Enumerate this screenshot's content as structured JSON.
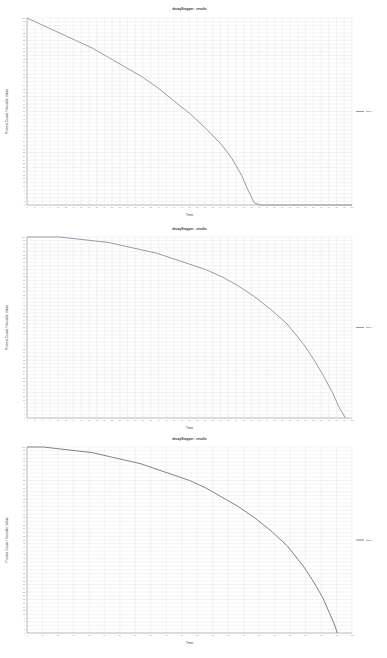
{
  "charts": [
    {
      "title": "decayStopper - results",
      "xlabel": "Time",
      "ylabel": "Protein Count / Variable Value",
      "legend": "DECAY",
      "line_color": "#8c8fa6"
    },
    {
      "title": "decayStopper - results",
      "xlabel": "Time",
      "ylabel": "Protein Count / Variable Value",
      "legend": "DECAY",
      "line_color": "#8c8fa6"
    },
    {
      "title": "decayStopper - results",
      "xlabel": "Time",
      "ylabel": "Protein Count / Variable Value",
      "legend": "DECAY",
      "line_color": "#6f7286"
    }
  ],
  "chart_data": [
    {
      "type": "line",
      "title": "decayStopper - results",
      "xlabel": "Time",
      "ylabel": "Protein Count / Variable Value",
      "xlim": [
        0,
        100
      ],
      "ylim": [
        0,
        100
      ],
      "grid": true,
      "legend_position": "right",
      "series": [
        {
          "name": "DECAY",
          "x": [
            0,
            5,
            10,
            15,
            20,
            25,
            30,
            35,
            40,
            45,
            50,
            55,
            60,
            63,
            66,
            68,
            70,
            72,
            75,
            80,
            85,
            90,
            95,
            100
          ],
          "y": [
            100,
            96,
            92,
            88,
            84,
            79,
            74,
            69,
            63,
            56,
            49,
            41,
            32,
            25,
            16,
            8,
            1,
            0,
            0,
            0,
            0,
            0,
            0,
            0
          ]
        }
      ]
    },
    {
      "type": "line",
      "title": "decayStopper - results",
      "xlabel": "Time",
      "ylabel": "Protein Count / Variable Value",
      "xlim": [
        0,
        100
      ],
      "ylim": [
        0,
        100
      ],
      "grid": true,
      "legend_position": "right",
      "series": [
        {
          "name": "DECAY",
          "x": [
            0,
            5,
            10,
            15,
            20,
            25,
            30,
            35,
            40,
            45,
            50,
            55,
            60,
            65,
            70,
            75,
            80,
            85,
            88,
            91,
            94,
            96,
            98
          ],
          "y": [
            100,
            100,
            100,
            99,
            98,
            97,
            95,
            93,
            91,
            88,
            85,
            82,
            78,
            73,
            67,
            60,
            52,
            41,
            33,
            24,
            14,
            6,
            0
          ]
        }
      ]
    },
    {
      "type": "line",
      "title": "decayStopper - results",
      "xlabel": "Time",
      "ylabel": "Protein Count / Variable Value",
      "xlim": [
        0,
        100
      ],
      "ylim": [
        0,
        100
      ],
      "grid": true,
      "legend_position": "right",
      "series": [
        {
          "name": "DECAY",
          "x": [
            0,
            5,
            10,
            15,
            20,
            25,
            30,
            35,
            40,
            45,
            50,
            55,
            60,
            65,
            70,
            75,
            80,
            85,
            88,
            91,
            93,
            94.5,
            95.5
          ],
          "y": [
            100,
            100,
            99,
            98,
            97,
            95,
            93,
            91,
            88,
            85,
            82,
            78,
            73,
            68,
            62,
            55,
            47,
            36,
            28,
            19,
            11,
            5,
            0
          ]
        }
      ]
    }
  ]
}
